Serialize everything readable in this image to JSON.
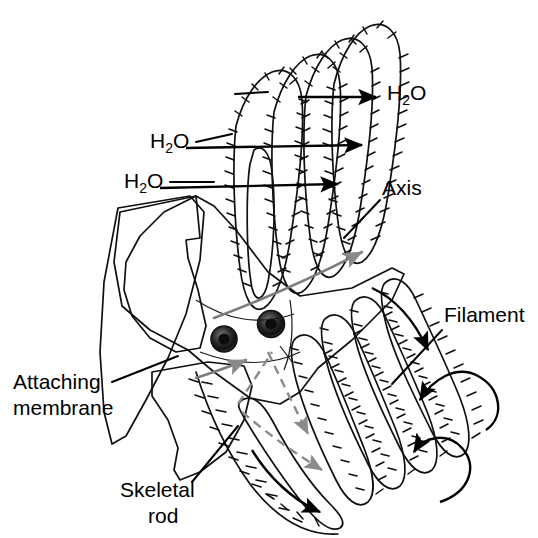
{
  "figure": {
    "background_color": "#ffffff",
    "ink_color": "#000000",
    "blood_flow_color": "#8a8a8a",
    "tissue_light": "#e8e8e8",
    "tissue_mid": "#bcbcbc",
    "tissue_dark": "#6e6e6e",
    "cavity_dark": "#3d3d3d"
  },
  "labels": {
    "water_upper_left": {
      "text_main": "H",
      "text_sub": "2",
      "text_tail": "O",
      "full_text": "H2O",
      "x": 150,
      "y": 148
    },
    "water_lower_left": {
      "text_main": "H",
      "text_sub": "2",
      "text_tail": "O",
      "full_text": "H2O",
      "x": 124,
      "y": 188
    },
    "water_right": {
      "text_main": "H",
      "text_sub": "2",
      "text_tail": "O",
      "full_text": "H2O",
      "x": 387,
      "y": 100
    },
    "axis": {
      "text": "Axis",
      "x": 382,
      "y": 195
    },
    "filament": {
      "text": "Filament",
      "x": 444,
      "y": 322
    },
    "attaching_membrane": {
      "line1": "Attaching",
      "line2": "membrane",
      "x": 13,
      "y": 389
    },
    "skeletal_rod": {
      "line1": "Skeletal",
      "line2": "rod",
      "x": 120,
      "y": 497
    }
  },
  "anatomy": {
    "parts": [
      "upper filament row",
      "lower filament row",
      "gill axis",
      "skeletal rod",
      "attaching membrane",
      "afferent blood vessel",
      "efferent blood vessel",
      "ciliated filament margin"
    ],
    "flow_legend": {
      "water_flow": "black arrows",
      "blood_flow": "gray arrows"
    }
  }
}
